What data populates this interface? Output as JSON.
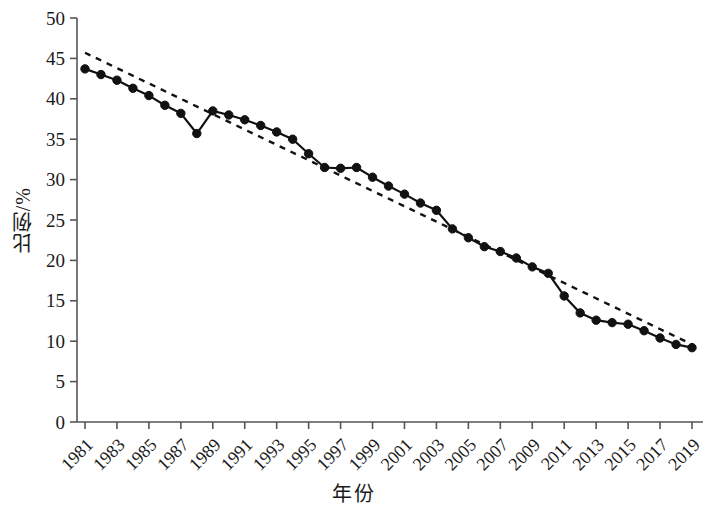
{
  "chart_data": {
    "type": "line",
    "title": "",
    "xlabel": "年份",
    "ylabel": "比例/%",
    "xlim": [
      1981,
      2019
    ],
    "ylim": [
      0,
      50
    ],
    "ytick_values": [
      0,
      5,
      10,
      15,
      20,
      25,
      30,
      35,
      40,
      45,
      50
    ],
    "xtick_labels": [
      "1981",
      "1983",
      "1985",
      "1987",
      "1989",
      "1991",
      "1993",
      "1995",
      "1997",
      "1999",
      "2001",
      "2003",
      "2005",
      "2007",
      "2009",
      "2011",
      "2013",
      "2015",
      "2017",
      "2019"
    ],
    "xtick_values": [
      1981,
      1983,
      1985,
      1987,
      1989,
      1991,
      1993,
      1995,
      1997,
      1999,
      2001,
      2003,
      2005,
      2007,
      2009,
      2011,
      2013,
      2015,
      2017,
      2019
    ],
    "grid": false,
    "legend": null,
    "x": [
      1981,
      1982,
      1983,
      1984,
      1985,
      1986,
      1987,
      1988,
      1989,
      1990,
      1991,
      1992,
      1993,
      1994,
      1995,
      1996,
      1997,
      1998,
      1999,
      2000,
      2001,
      2002,
      2003,
      2004,
      2005,
      2006,
      2007,
      2008,
      2009,
      2010,
      2011,
      2012,
      2013,
      2014,
      2015,
      2016,
      2017,
      2018,
      2019
    ],
    "series": [
      {
        "name": "比例",
        "style": "solid-with-markers",
        "color": "#111111",
        "marker": "filled-circle",
        "values": [
          43.7,
          43.0,
          42.3,
          41.3,
          40.4,
          39.2,
          38.2,
          35.7,
          38.5,
          38.0,
          37.4,
          36.7,
          35.9,
          35.0,
          33.2,
          31.5,
          31.4,
          31.5,
          30.3,
          29.2,
          28.2,
          27.1,
          26.2,
          23.9,
          22.8,
          21.7,
          21.1,
          20.3,
          19.2,
          18.4,
          15.6,
          13.5,
          12.6,
          12.3,
          12.1,
          11.3,
          10.4,
          9.6,
          9.2
        ]
      },
      {
        "name": "线性趋势",
        "style": "dashed",
        "color": "#111111",
        "marker": "none",
        "trend_endpoints": [
          [
            1981,
            45.7
          ],
          [
            2019,
            9.6
          ]
        ]
      }
    ]
  }
}
